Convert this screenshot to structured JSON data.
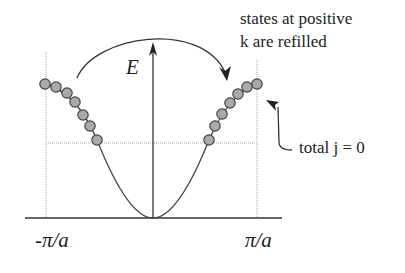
{
  "diagram": {
    "type": "band-dispersion",
    "axis_labels": {
      "energy": "E",
      "k_left": "-π/a",
      "k_right": "π/a"
    },
    "annotations": {
      "refill_line1": "states at positive",
      "refill_line2": "k are refilled",
      "total_j": "total j = 0"
    },
    "colors": {
      "line": "#333333",
      "dot_fill": "#a9a9a9",
      "dot_stroke": "#444444",
      "guide": "#999999"
    },
    "left_dots": [
      [
        45,
        84
      ],
      [
        56,
        87
      ],
      [
        67,
        93
      ],
      [
        75,
        102
      ],
      [
        83,
        115
      ],
      [
        90,
        126
      ],
      [
        97,
        140
      ]
    ],
    "right_dots": [
      [
        257,
        84
      ],
      [
        247,
        87
      ],
      [
        238,
        94
      ],
      [
        230,
        103
      ],
      [
        222,
        114
      ],
      [
        215,
        126
      ],
      [
        209,
        140
      ]
    ]
  }
}
